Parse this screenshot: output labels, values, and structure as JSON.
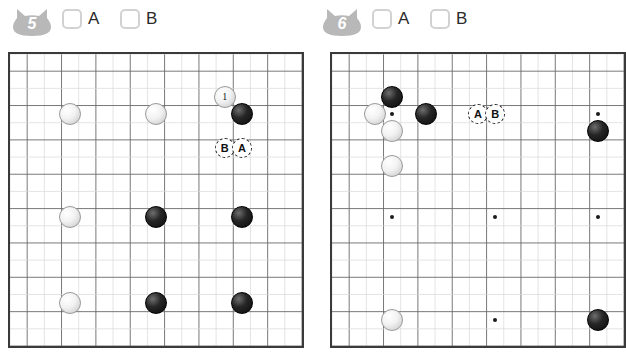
{
  "panels": [
    {
      "id": "5",
      "badge_number": "5",
      "badge_icon": "cat-head-badge",
      "badge_color": "#b8b8b8",
      "checkboxes": [
        {
          "label": "A",
          "checked": false
        },
        {
          "label": "B",
          "checked": false
        }
      ],
      "board": {
        "cols": 17,
        "rows": 17,
        "show_hoshi": false,
        "stones": [
          {
            "color": "white",
            "col": 3,
            "row": 3,
            "label": ""
          },
          {
            "color": "white",
            "col": 8,
            "row": 3,
            "label": ""
          },
          {
            "color": "white",
            "col": 12,
            "row": 2,
            "label": "1"
          },
          {
            "color": "black",
            "col": 13,
            "row": 3,
            "label": ""
          },
          {
            "color": "white",
            "col": 3,
            "row": 9,
            "label": ""
          },
          {
            "color": "black",
            "col": 8,
            "row": 9,
            "label": ""
          },
          {
            "color": "black",
            "col": 13,
            "row": 9,
            "label": ""
          },
          {
            "color": "white",
            "col": 3,
            "row": 14,
            "label": ""
          },
          {
            "color": "black",
            "col": 8,
            "row": 14,
            "label": ""
          },
          {
            "color": "black",
            "col": 13,
            "row": 14,
            "label": ""
          }
        ],
        "markers": [
          {
            "label": "B",
            "col": 12,
            "row": 5
          },
          {
            "label": "A",
            "col": 13,
            "row": 5
          }
        ]
      }
    },
    {
      "id": "6",
      "badge_number": "6",
      "badge_icon": "cat-head-badge",
      "badge_color": "#b8b8b8",
      "checkboxes": [
        {
          "label": "A",
          "checked": false
        },
        {
          "label": "B",
          "checked": false
        }
      ],
      "board": {
        "cols": 17,
        "rows": 17,
        "show_hoshi": true,
        "hoshi": [
          {
            "col": 3,
            "row": 3
          },
          {
            "col": 9,
            "row": 3
          },
          {
            "col": 15,
            "row": 3
          },
          {
            "col": 3,
            "row": 9
          },
          {
            "col": 9,
            "row": 9
          },
          {
            "col": 15,
            "row": 9
          },
          {
            "col": 3,
            "row": 15
          },
          {
            "col": 9,
            "row": 15
          },
          {
            "col": 15,
            "row": 15
          }
        ],
        "stones": [
          {
            "color": "black",
            "col": 3,
            "row": 2,
            "label": ""
          },
          {
            "color": "white",
            "col": 2,
            "row": 3,
            "label": ""
          },
          {
            "color": "black",
            "col": 5,
            "row": 3,
            "label": ""
          },
          {
            "color": "white",
            "col": 3,
            "row": 4,
            "label": ""
          },
          {
            "color": "white",
            "col": 3,
            "row": 6,
            "label": ""
          },
          {
            "color": "black",
            "col": 15,
            "row": 4,
            "label": ""
          },
          {
            "color": "white",
            "col": 3,
            "row": 15,
            "label": ""
          },
          {
            "color": "black",
            "col": 15,
            "row": 15,
            "label": ""
          }
        ],
        "markers": [
          {
            "label": "A",
            "col": 8,
            "row": 3
          },
          {
            "label": "B",
            "col": 9,
            "row": 3
          }
        ]
      }
    }
  ]
}
